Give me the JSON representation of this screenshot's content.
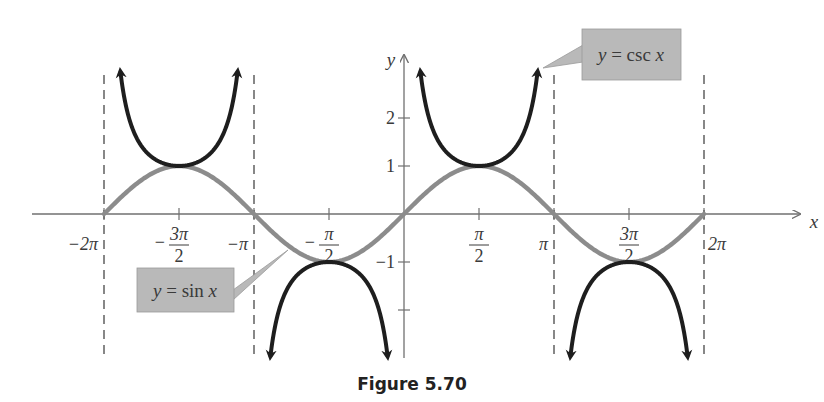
{
  "chart_data": {
    "type": "line",
    "title": "",
    "caption": "Figure 5.70",
    "xlabel": "x",
    "ylabel": "y",
    "xlim": [
      -6.2832,
      6.2832
    ],
    "ylim": [
      -3,
      3
    ],
    "x_ticks": [
      {
        "value": -6.2832,
        "label": "−2π"
      },
      {
        "value": -4.7124,
        "label": "−3π/2",
        "num": "3π",
        "den": "2",
        "neg": true
      },
      {
        "value": -3.1416,
        "label": "−π"
      },
      {
        "value": -1.5708,
        "label": "−π/2",
        "num": "π",
        "den": "2",
        "neg": true
      },
      {
        "value": 1.5708,
        "label": "π/2",
        "num": "π",
        "den": "2",
        "neg": false
      },
      {
        "value": 3.1416,
        "label": "π"
      },
      {
        "value": 4.7124,
        "label": "3π/2",
        "num": "3π",
        "den": "2",
        "neg": false
      },
      {
        "value": 6.2832,
        "label": "2π"
      }
    ],
    "y_ticks": [
      {
        "value": 2,
        "label": "2"
      },
      {
        "value": 1,
        "label": "1"
      },
      {
        "value": -1,
        "label": "−1"
      },
      {
        "value": -2,
        "label": ""
      }
    ],
    "asymptotes": [
      -6.2832,
      -3.1416,
      3.1416,
      6.2832
    ],
    "series": [
      {
        "name": "y = sin x",
        "color": "#8c8c8c",
        "style": "solid",
        "domain": [
          -6.2832,
          6.2832
        ]
      },
      {
        "name": "y = csc x",
        "color": "#1e1e1e",
        "style": "solid-arrows",
        "branches": [
          [
            -6.2832,
            -3.1416
          ],
          [
            -3.1416,
            0
          ],
          [
            0,
            3.1416
          ],
          [
            3.1416,
            6.2832
          ]
        ]
      }
    ],
    "annotations": [
      {
        "text": "y = csc x",
        "box_color": "#b9b9b9"
      },
      {
        "text": "y = sin x",
        "box_color": "#b9b9b9"
      }
    ],
    "grid": false,
    "legend": "callout labels"
  },
  "labels": {
    "csc_label_y": "y",
    "csc_label_eq": " = csc ",
    "csc_label_x": "x",
    "sin_label_y": "y",
    "sin_label_eq": " = sin ",
    "sin_label_x": "x",
    "x_axis": "x",
    "y_axis": "y",
    "caption": "Figure 5.70"
  },
  "colors": {
    "sin_curve": "#8c8c8c",
    "csc_curve": "#1e1e1e",
    "axis": "#707070",
    "asymptote": "#555555",
    "callout_fill": "#b9b9b9"
  }
}
